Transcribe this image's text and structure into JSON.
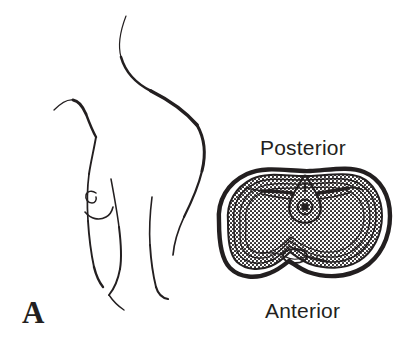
{
  "figure": {
    "panel_label": "A",
    "type": "anatomical-line-drawing",
    "background_color": "#ffffff",
    "ink_color": "#231f20",
    "labels": {
      "posterior": "Posterior",
      "anterior": "Anterior"
    },
    "body_outline": {
      "name": "human-torso-profile",
      "description": "Left lateral profile line drawing of a human torso, neck, shoulder, chest with nipple, and upper limb",
      "strokes": [
        {
          "name": "neck-and-shoulder-contour",
          "d": "M126,16 C122,30 118,44 122,58 C126,72 136,84 152,92 C170,101 186,112 198,126"
        },
        {
          "name": "back-and-flank-contour",
          "d": "M198,126 C206,140 207,156 203,172 C199,189 192,204 185,218 C179,231 175,244 174,256"
        },
        {
          "name": "shoulder-top-and-arm-front",
          "d": "M55,110 C62,104 68,100 74,101 C80,102 84,108 87,115 C90,123 93,131 97,138"
        },
        {
          "name": "arm-front-to-chest",
          "d": "M97,138 C95,150 92,162 90,175 C88,190 88,206 89,222 C90,238 92,254 95,268"
        },
        {
          "name": "chest-side-lower",
          "d": "M95,268 C97,276 100,283 104,288"
        },
        {
          "name": "torso-front-contour",
          "d": "M110,180 C113,196 116,212 118,228 C120,244 121,258 119,270 C117,281 113,290 108,296"
        },
        {
          "name": "flank-crease",
          "d": "M108,296 C112,302 117,307 123,311"
        },
        {
          "name": "nipple-areola-curl",
          "d": "M95,194 C91,191 87,192 86,196 C85,200 88,204 92,204 C95,204 97,201 96,198"
        },
        {
          "name": "breast-underside-crease",
          "d": "M85,213 C91,220 99,222 106,218 C110,216 112,212 113,208"
        },
        {
          "name": "abdomen-contour",
          "d": "M152,198 C150,214 149,230 150,246 C151,262 153,276 156,288"
        },
        {
          "name": "thigh-medial-contour",
          "d": "M156,288 C158,295 162,299 168,300"
        }
      ]
    },
    "cross_section": {
      "name": "thoracic-transverse-cross-section",
      "description": "Transverse (axial) cross-section of the thorax shaped like a rounded kidney bean with a notch at anterior midline; wall is built from a heavy outer line, a stippled band, and thin concentric inner lines; a central vertebral/mediastinal structure sits at the posterior midline",
      "layers": [
        {
          "name": "outer-heavy-contour",
          "stroke_width": 4.2
        },
        {
          "name": "stippled-band",
          "pattern": "dotted"
        },
        {
          "name": "inner-thin-contour-1",
          "stroke_width": 1.5
        },
        {
          "name": "inner-thin-contour-2",
          "stroke_width": 1.3
        },
        {
          "name": "inner-thin-contour-3",
          "stroke_width": 1.2
        }
      ],
      "central_structure": {
        "name": "vertebral-body-and-canal",
        "parts": [
          "teardrop-outer-outline",
          "inner-circular-canal",
          "lateral-wing-processes",
          "posterior-spinous-tip"
        ]
      },
      "anterior_notch": {
        "name": "anterior-midline-notch",
        "description": "Indentation at the anterior (bottom) midline containing a small oval structure"
      }
    }
  }
}
